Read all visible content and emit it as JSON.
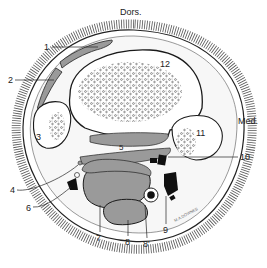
{
  "diagram": {
    "type": "anatomical cross-section",
    "orientation": {
      "top": "Dors.",
      "right": "Med."
    },
    "labels": [
      {
        "id": "1",
        "text": "1"
      },
      {
        "id": "2",
        "text": "2"
      },
      {
        "id": "3",
        "text": "3"
      },
      {
        "id": "4",
        "text": "4"
      },
      {
        "id": "5",
        "text": "5"
      },
      {
        "id": "6",
        "text": "6"
      },
      {
        "id": "7",
        "text": "7"
      },
      {
        "id": "8",
        "text": "8"
      },
      {
        "id": "8p",
        "text": "8'"
      },
      {
        "id": "9",
        "text": "9"
      },
      {
        "id": "10",
        "text": "10"
      },
      {
        "id": "11",
        "text": "11"
      },
      {
        "id": "12",
        "text": "12"
      }
    ],
    "signature": "M.A.DOWNES",
    "colors": {
      "tissue_gray": "#9a9a9a",
      "outline": "#1a1a1a",
      "fat_light": "#e6e6e6",
      "vessel_black": "#111111"
    }
  }
}
